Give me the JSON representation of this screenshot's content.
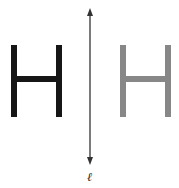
{
  "diagram": {
    "type": "reflection",
    "original": {
      "letter": "H",
      "color": "#161616"
    },
    "image": {
      "letter": "H",
      "color": "#878787"
    },
    "line": {
      "label": "ℓ",
      "color": "#333333",
      "orientation": "vertical",
      "arrows": "both ends"
    }
  }
}
